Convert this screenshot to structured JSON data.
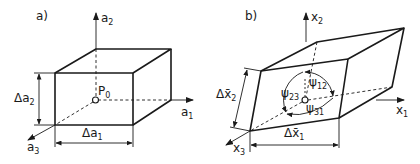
{
  "panels": {
    "a": {
      "label": "a)",
      "axes": {
        "vertical": {
          "base": "a",
          "sub": "2"
        },
        "horizontal": {
          "base": "a",
          "sub": "1"
        },
        "depth": {
          "base": "a",
          "sub": "3"
        }
      },
      "point": {
        "base": "P",
        "sub": "0"
      },
      "dim_vertical": {
        "base": "Δa",
        "sub": "2"
      },
      "dim_horizontal": {
        "base": "Δa",
        "sub": "1"
      }
    },
    "b": {
      "label": "b)",
      "axes": {
        "vertical": {
          "base": "x",
          "sub": "2"
        },
        "horizontal": {
          "base": "x",
          "sub": "1"
        },
        "depth": {
          "base": "x",
          "sub": "3"
        }
      },
      "angles": [
        {
          "base": "ψ",
          "sub": "12"
        },
        {
          "base": "ψ",
          "sub": "23"
        },
        {
          "base": "ψ",
          "sub": "31"
        }
      ],
      "dim_vertical": {
        "base": "Δx̄",
        "sub": "2"
      },
      "dim_horizontal": {
        "base": "Δx̄",
        "sub": "1"
      }
    }
  }
}
